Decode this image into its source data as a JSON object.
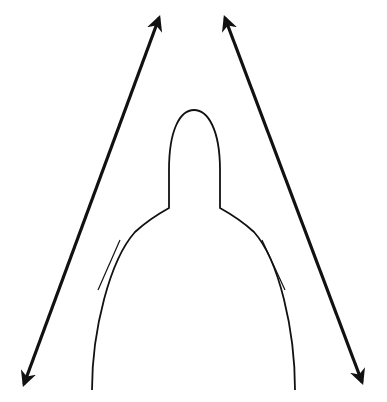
{
  "diagram": {
    "colors": {
      "background": "#ffffff",
      "stroke": "#111111"
    },
    "shape": {
      "name": "dome-with-spire",
      "left_base": [
        92,
        390
      ],
      "right_base": [
        295,
        390
      ],
      "left_shoulder": [
        169,
        208
      ],
      "right_shoulder": [
        220,
        208
      ],
      "spire_top": [
        194,
        110
      ]
    },
    "arrows": [
      {
        "name": "left-tangent-arrow",
        "from": [
          22,
          387
        ],
        "to": [
          160,
          15
        ],
        "double_headed": true
      },
      {
        "name": "right-tangent-arrow",
        "from": [
          364,
          385
        ],
        "to": [
          224,
          15
        ],
        "double_headed": true
      }
    ],
    "labels": []
  }
}
